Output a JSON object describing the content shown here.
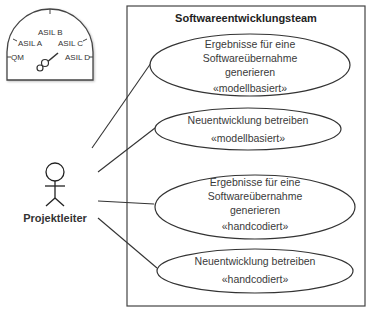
{
  "diagram": {
    "type": "uml-use-case",
    "system_boundary": {
      "title": "Softwareentwicklungsteam"
    },
    "actor": {
      "label": "Projektleiter"
    },
    "use_cases": [
      {
        "lines": [
          "Ergebnisse für eine",
          "Softwareübernahme",
          "generieren"
        ],
        "stereotype": "«modellbasiert»"
      },
      {
        "lines": [
          "Neuentwicklung betreiben"
        ],
        "stereotype": "«modellbasiert»"
      },
      {
        "lines": [
          "Ergebnisse für eine",
          "Softwareübernahme",
          "generieren"
        ],
        "stereotype": "«handcodiert»"
      },
      {
        "lines": [
          "Neuentwicklung betreiben"
        ],
        "stereotype": "«handcodiert»"
      }
    ],
    "gauge": {
      "labels": [
        "QM",
        "ASIL A",
        "ASIL B",
        "ASIL C",
        "ASIL D"
      ]
    },
    "colors": {
      "stroke": "#333333",
      "background": "#ffffff"
    }
  }
}
